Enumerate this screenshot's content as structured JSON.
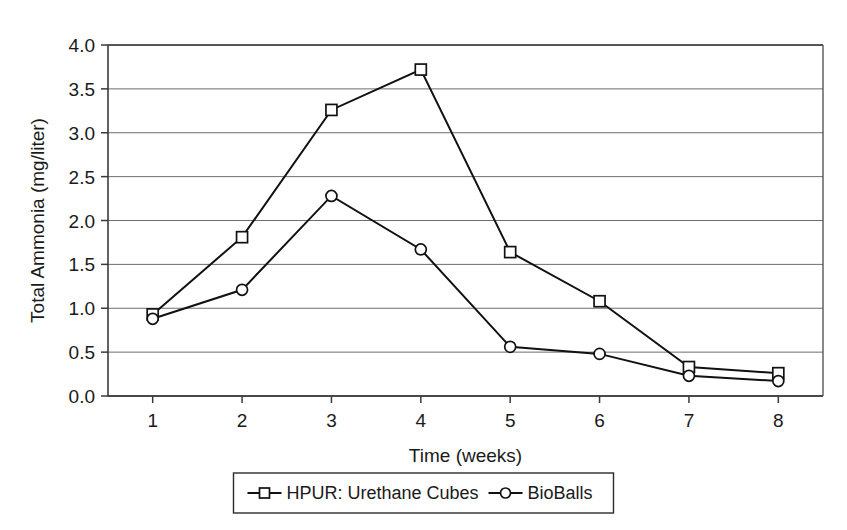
{
  "chart_data": {
    "type": "line",
    "title": "",
    "xlabel": "Time (weeks)",
    "ylabel": "Total Ammonia (mg/liter)",
    "x": [
      1,
      2,
      3,
      4,
      5,
      6,
      7,
      8
    ],
    "categories": [
      "1",
      "2",
      "3",
      "4",
      "5",
      "6",
      "7",
      "8"
    ],
    "xlim": [
      0.5,
      8.5
    ],
    "ylim": [
      0.0,
      4.0
    ],
    "y_ticks": [
      0.0,
      0.5,
      1.0,
      1.5,
      2.0,
      2.5,
      3.0,
      3.5,
      4.0
    ],
    "y_tick_labels": [
      "0.0",
      "0.5",
      "1.0",
      "1.5",
      "2.0",
      "2.5",
      "3.0",
      "3.5",
      "4.0"
    ],
    "grid": "horizontal",
    "legend_position": "bottom-center",
    "series": [
      {
        "name": "HPUR: Urethane Cubes",
        "marker": "square",
        "color": "#111111",
        "values": [
          0.93,
          1.81,
          3.26,
          3.72,
          1.64,
          1.08,
          0.33,
          0.26
        ]
      },
      {
        "name": "BioBalls",
        "marker": "circle",
        "color": "#111111",
        "values": [
          0.88,
          1.21,
          2.28,
          1.67,
          0.56,
          0.48,
          0.23,
          0.17
        ]
      }
    ]
  },
  "legend": {
    "entries": [
      {
        "label": "HPUR: Urethane Cubes",
        "marker": "square"
      },
      {
        "label": "BioBalls",
        "marker": "circle"
      }
    ]
  }
}
